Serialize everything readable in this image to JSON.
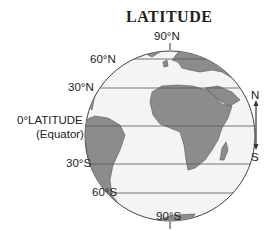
{
  "title": "LATITUDE",
  "labels": {
    "north_pole": "90°N",
    "lat_60n": "60°N",
    "lat_30n": "30°N",
    "equator_line1": "0°LATITUDE",
    "equator_line2": "(Equator)",
    "lat_30s": "30°S",
    "lat_60s": "60°S",
    "south_pole": "90°S"
  },
  "compass": {
    "north": "N",
    "south": "S"
  },
  "colors": {
    "land": "#8c8c8c",
    "ocean": "#f4f4f4",
    "lines": "#555555",
    "text": "#222222"
  }
}
